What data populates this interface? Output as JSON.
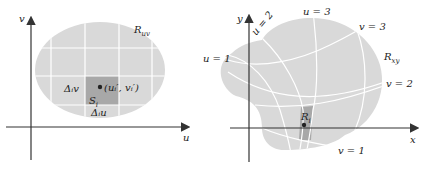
{
  "left_panel": {
    "axis_x_label": "u",
    "axis_y_label": "v",
    "region_label": "R",
    "region_label_sub": "uv",
    "cell_label": "S",
    "cell_label_sub": "i",
    "delta_v_label": "Δᵢv",
    "delta_u_label": "Δᵢu",
    "point_label": "(uᵢ′, vᵢ′)"
  },
  "right_panel": {
    "axis_x_label": "x",
    "axis_y_label": "y",
    "region_label": "R",
    "region_label_sub": "xy",
    "cell_label": "R",
    "cell_label_sub": "i",
    "curve_labels": {
      "u1": "u = 1",
      "u2": "u = 2",
      "u3": "u = 3",
      "v1": "v = 1",
      "v2": "v = 2",
      "v3": "v = 3"
    }
  },
  "colors": {
    "region_fill": "#d9d9d9",
    "cell_fill": "#a8a8a8",
    "grid_line": "#ffffff",
    "axis": "#333333"
  }
}
